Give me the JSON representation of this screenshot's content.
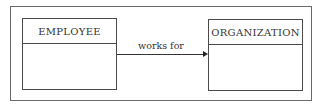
{
  "diagram": {
    "type": "entity-relationship",
    "entities": [
      {
        "name": "EMPLOYEE"
      },
      {
        "name": "ORGANIZATION"
      }
    ],
    "relationship": {
      "label": "works for",
      "from": "EMPLOYEE",
      "to": "ORGANIZATION",
      "direction": "arrow-to-target"
    }
  }
}
